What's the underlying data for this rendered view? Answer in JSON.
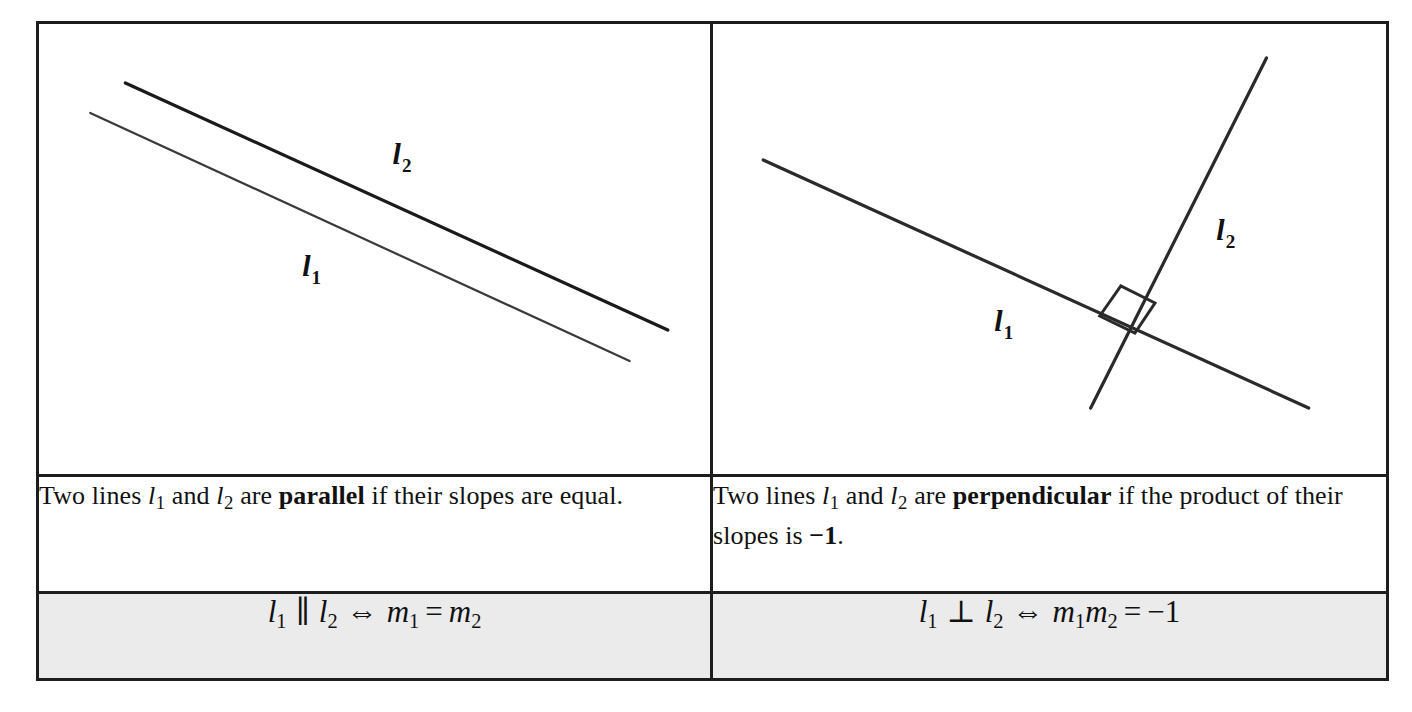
{
  "table": {
    "columns": [
      {
        "id": "parallel",
        "figure": {
          "caption_hidden": "parallel-lines-diagram",
          "labels": [
            {
              "name": "line-label-l2",
              "base": "l",
              "sub": "2",
              "x": 352,
              "y": 140
            },
            {
              "name": "line-label-l1",
              "base": "l",
              "sub": "1",
              "x": 262,
              "y": 252
            }
          ],
          "lines": [
            {
              "name": "line-l2",
              "x1": 86,
              "y1": 59,
              "x2": 626,
              "y2": 306,
              "width": 3.2
            },
            {
              "name": "line-l1",
              "x1": 51,
              "y1": 89,
              "x2": 588,
              "y2": 337,
              "width": 2.2
            }
          ]
        },
        "description": {
          "prefix": "Two lines ",
          "var1": "l",
          "var1_sub": "1",
          "mid1": " and ",
          "var2": "l",
          "var2_sub": "2",
          "mid2": " are ",
          "term": "parallel",
          "suffix": " if their slopes are equal."
        },
        "formula": {
          "left_var": "l",
          "left_sub": "1",
          "relation": "∥",
          "right_var": "l",
          "right_sub": "2",
          "equiv": "⇔",
          "result_left_var": "m",
          "result_left_sub": "1",
          "result_op": "=",
          "result_right_var": "m",
          "result_right_sub": "2",
          "plain": "l1 ∥ l2 ⇔ m1 = m2"
        }
      },
      {
        "id": "perpendicular",
        "figure": {
          "caption_hidden": "perpendicular-lines-diagram",
          "labels": [
            {
              "name": "line-label-l2",
              "base": "l",
              "sub": "2",
              "x": 501,
              "y": 216
            },
            {
              "name": "line-label-l1",
              "base": "l",
              "sub": "1",
              "x": 280,
              "y": 307
            }
          ],
          "lines": [
            {
              "name": "line-l1",
              "x1": 50,
              "y1": 136,
              "x2": 593,
              "y2": 384,
              "width": 3.2
            },
            {
              "name": "line-l2",
              "x1": 376,
              "y1": 384,
              "x2": 551,
              "y2": 34,
              "width": 3.2
            }
          ],
          "right_angle_marker": {
            "name": "right-angle-marker",
            "points": "385,292 406,262 440,279 420,309"
          }
        },
        "description": {
          "prefix": "Two lines ",
          "var1": "l",
          "var1_sub": "1",
          "mid1": " and ",
          "var2": "l",
          "var2_sub": "2",
          "mid2": " are ",
          "term": "perpendicular",
          "suffix": " if the product of their slopes is ",
          "value": "−1",
          "period": "."
        },
        "formula": {
          "left_var": "l",
          "left_sub": "1",
          "relation": "⊥",
          "right_var": "l",
          "right_sub": "2",
          "equiv": "⇔",
          "result_left_var": "m",
          "result_left_sub": "1",
          "result_mid_var": "m",
          "result_mid_sub": "2",
          "result_op": "=",
          "result_value": "−1",
          "plain": "l1 ⊥ l2 ⇔ m1m2 = −1"
        }
      }
    ]
  },
  "colors": {
    "border": "#1d1d1d",
    "ink": "#111111",
    "formula_row_background": "#ebebeb",
    "page_background": "#ffffff"
  }
}
